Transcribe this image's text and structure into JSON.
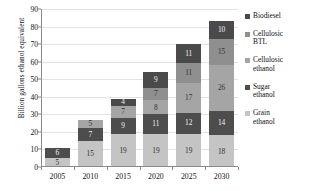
{
  "chart_data": {
    "type": "bar",
    "stacked": true,
    "title": "",
    "xlabel": "",
    "ylabel": "Billion gallons ethanol equivalent",
    "categories": [
      "2005",
      "2010",
      "2015",
      "2020",
      "2025",
      "2030"
    ],
    "ylim": [
      0,
      90
    ],
    "yticks": [
      "0",
      "10",
      "20",
      "30",
      "40",
      "50",
      "60",
      "70",
      "80",
      "90"
    ],
    "grid": true,
    "legend_position": "right",
    "series": [
      {
        "name": "Grain ethanol",
        "color": "#c4c4c4",
        "label_color": "#333333",
        "values": [
          5,
          15,
          19,
          19,
          19,
          18
        ],
        "labels": [
          "5",
          "15",
          "19",
          "19",
          "19",
          "18"
        ]
      },
      {
        "name": "Sugar ethanol",
        "color": "#4d4d4d",
        "label_color": "#f0f0f0",
        "values": [
          6,
          7,
          9,
          11,
          12,
          14
        ],
        "labels": [
          "6",
          "7",
          "9",
          "11",
          "12",
          "14"
        ]
      },
      {
        "name": "Cellulosic ethanol",
        "color": "#a5a5a5",
        "label_color": "#333333",
        "values": [
          0,
          5,
          7,
          8,
          17,
          26
        ],
        "labels": [
          "",
          "5",
          "7",
          "8",
          "17",
          "26"
        ]
      },
      {
        "name": "Cellulosic BTL",
        "color": "#8f8f8f",
        "label_color": "#333333",
        "values": [
          0,
          0,
          0,
          7,
          11,
          15
        ],
        "labels": [
          "",
          "",
          "",
          "7",
          "11",
          "15"
        ]
      },
      {
        "name": "Biodiesel",
        "color": "#4a4a4a",
        "label_color": "#f0f0f0",
        "values": [
          0,
          0,
          4,
          9,
          11,
          10
        ],
        "labels": [
          "",
          "",
          "4",
          "9",
          "11",
          "10"
        ]
      }
    ],
    "totals": [
      11,
      27,
      39,
      54,
      70,
      83
    ],
    "legend": [
      {
        "label": "Biodiesel",
        "color": "#4a4a4a"
      },
      {
        "label": "Cellulosic\nBTL",
        "color": "#8f8f8f"
      },
      {
        "label": "Cellulosic\nethanol",
        "color": "#a5a5a5"
      },
      {
        "label": "Sugar\nethanol",
        "color": "#4d4d4d"
      },
      {
        "label": "Grain\nethanol",
        "color": "#c4c4c4"
      }
    ]
  }
}
